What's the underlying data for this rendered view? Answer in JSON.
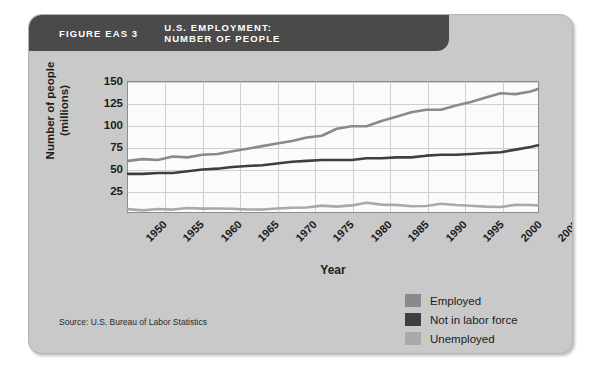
{
  "figure": {
    "number": "FIGURE EAS 3",
    "title": "U.S. EMPLOYMENT:\nNUMBER OF PEOPLE",
    "source": "Source: U.S. Bureau of Labor Statistics"
  },
  "legend": {
    "items": [
      {
        "label": "Employed",
        "color": "#8a8a8a"
      },
      {
        "label": "Not in labor force",
        "color": "#3f3f3f"
      },
      {
        "label": "Unemployed",
        "color": "#a9a9a9"
      }
    ]
  },
  "chart_data": {
    "type": "line",
    "title": "U.S. EMPLOYMENT: NUMBER OF PEOPLE",
    "xlabel": "Year",
    "ylabel": "Number of people (millions)",
    "xlim": [
      1950,
      2005
    ],
    "ylim": [
      0,
      150
    ],
    "grid": true,
    "legend_position": "bottom-right",
    "xticks": [
      1950,
      1955,
      1960,
      1965,
      1970,
      1975,
      1980,
      1985,
      1990,
      1995,
      2000,
      2005
    ],
    "yticks": [
      25,
      50,
      75,
      100,
      125,
      150
    ],
    "x": [
      1950,
      1952,
      1954,
      1956,
      1958,
      1960,
      1962,
      1964,
      1966,
      1968,
      1970,
      1972,
      1974,
      1976,
      1978,
      1980,
      1982,
      1984,
      1986,
      1988,
      1990,
      1992,
      1994,
      1996,
      1998,
      2000,
      2002,
      2004,
      2005
    ],
    "series": [
      {
        "name": "Employed",
        "color": "#8a8a8a",
        "values": [
          59,
          61,
          60,
          64,
          63,
          66,
          67,
          70,
          73,
          76,
          79,
          82,
          86,
          88,
          96,
          99,
          99,
          105,
          110,
          115,
          118,
          118,
          123,
          127,
          132,
          137,
          136,
          139,
          142
        ]
      },
      {
        "name": "Not in labor force",
        "color": "#3f3f3f",
        "values": [
          44,
          44,
          45,
          45,
          47,
          49,
          50,
          52,
          53,
          54,
          56,
          58,
          59,
          60,
          60,
          60,
          62,
          62,
          63,
          63,
          65,
          66,
          66,
          67,
          68,
          69,
          72,
          75,
          77
        ]
      },
      {
        "name": "Unemployed",
        "color": "#a9a9a9",
        "values": [
          3.3,
          1.9,
          3.5,
          2.8,
          4.6,
          3.9,
          4.0,
          3.8,
          2.9,
          2.8,
          4.1,
          4.9,
          5.2,
          7.4,
          6.2,
          7.6,
          10.7,
          8.5,
          8.2,
          6.7,
          7.0,
          9.6,
          8.0,
          7.2,
          6.2,
          5.7,
          8.4,
          8.1,
          7.6
        ]
      }
    ]
  }
}
